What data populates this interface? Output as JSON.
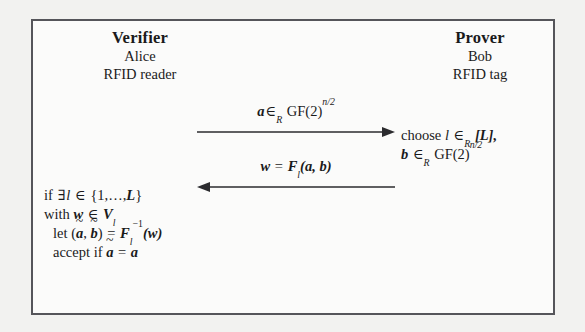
{
  "figure": {
    "kind": "protocol-diagram",
    "background_color": "#f2f2f0",
    "box_color": "#55555a",
    "box_fill": "#fbfbfa",
    "text_color": "#1a1a1a"
  },
  "verifier": {
    "role": "Verifier",
    "name": "Alice",
    "device": "RFID reader",
    "computation": {
      "line1": {
        "prefix": "if",
        "exists": "∃",
        "index": "l",
        "member": "∈",
        "set_open": "{1,",
        "ellipsis": ",",
        "bound": "L",
        "set_close": "}",
        "full": "if ∃l ∈ {1,…,L}"
      },
      "line2": {
        "prefix": "with",
        "var": "w",
        "member": "∈",
        "set": "V",
        "set_sub": "l",
        "full": "with w ∈ V_l"
      },
      "line3": {
        "prefix": "let",
        "pair_open": "(",
        "a_tilde": "a",
        "comma": ",",
        "b_tilde": "b",
        "pair_close": ")",
        "equals": "=",
        "func": "F",
        "func_sub": "l",
        "func_sup": "−1",
        "arg": "(w)",
        "full": "let (ã, b̃) = F_l^{-1}(w)"
      },
      "line4": {
        "prefix": "accept if",
        "a_tilde": "a",
        "equals": "=",
        "a": "a",
        "full": "accept if ã = a"
      }
    }
  },
  "prover": {
    "role": "Prover",
    "name": "Bob",
    "device": "RFID tag",
    "computation": {
      "line1": {
        "verb": "choose",
        "var": "l",
        "member": "∈",
        "member_sub": "R",
        "set": "[L],",
        "full": "choose l ∈_R [L],"
      },
      "line2": {
        "var": "b",
        "member": "∈",
        "member_sub": "R",
        "field": "GF(2)",
        "exponent": "n/2",
        "full": "b ∈_R GF(2)^{n/2}"
      }
    }
  },
  "messages": [
    {
      "id": "message-1",
      "direction": "verifier-to-prover",
      "label": {
        "var": "a",
        "member": "∈",
        "member_sub": "R",
        "field": "GF(2)",
        "exponent": "n/2",
        "full": "a ∈_R GF(2)^{n/2}"
      }
    },
    {
      "id": "message-2",
      "direction": "prover-to-verifier",
      "label": {
        "var": "w",
        "equals": "=",
        "func": "F",
        "func_sub": "l",
        "args": "(a, b)",
        "full": "w = F_l(a, b)"
      }
    }
  ]
}
